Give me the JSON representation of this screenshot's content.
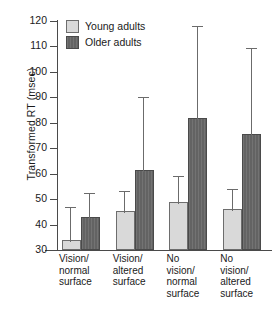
{
  "chart_data": {
    "type": "bar",
    "title": "",
    "xlabel": "",
    "ylabel": "Transformed RT (msec)",
    "ylim": [
      30,
      120
    ],
    "yticks": [
      30,
      40,
      50,
      60,
      70,
      80,
      90,
      100,
      110,
      120
    ],
    "ytick_labels": [
      "30",
      "40",
      "50",
      "60",
      "70",
      "80",
      "90",
      "100",
      "110",
      "120"
    ],
    "grid": false,
    "legend_position": "top-left",
    "categories": [
      "Vision/\nnormal\nsurface",
      "Vision/\naltered\nsurface",
      "No\nvision/\nnormal\nsurface",
      "No\nvision/\naltered\nsurface"
    ],
    "series": [
      {
        "name": "Young adults",
        "color": "#d9d9d9",
        "values": [
          33,
          44.5,
          48,
          45.5
        ],
        "error_upper": [
          47,
          53,
          59,
          54
        ]
      },
      {
        "name": "Older adults",
        "color": "#636363",
        "values": [
          42,
          60.5,
          81,
          75
        ],
        "error_upper": [
          52.5,
          90,
          118,
          109.5
        ]
      }
    ]
  },
  "legend": {
    "items": [
      {
        "label": "Young adults"
      },
      {
        "label": "Older adults"
      }
    ]
  }
}
